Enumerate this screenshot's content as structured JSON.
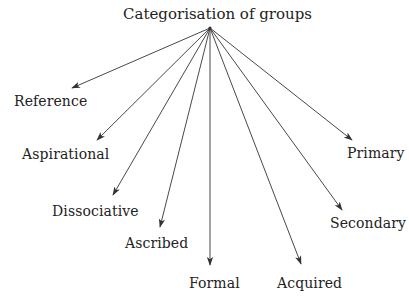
{
  "diagram": {
    "title": "Categorisation of groups",
    "line_color": "#333333",
    "text_color": "#222222",
    "root": "Categorisation of groups",
    "categories": [
      {
        "id": "reference",
        "label": "Reference"
      },
      {
        "id": "aspirational",
        "label": "Aspirational"
      },
      {
        "id": "dissociative",
        "label": "Dissociative"
      },
      {
        "id": "ascribed",
        "label": "Ascribed"
      },
      {
        "id": "formal",
        "label": "Formal"
      },
      {
        "id": "acquired",
        "label": "Acquired"
      },
      {
        "id": "secondary",
        "label": "Secondary"
      },
      {
        "id": "primary",
        "label": "Primary"
      }
    ],
    "edges": [
      {
        "from": "root",
        "to": "reference"
      },
      {
        "from": "root",
        "to": "aspirational"
      },
      {
        "from": "root",
        "to": "dissociative"
      },
      {
        "from": "root",
        "to": "ascribed"
      },
      {
        "from": "root",
        "to": "formal"
      },
      {
        "from": "root",
        "to": "acquired"
      },
      {
        "from": "root",
        "to": "secondary"
      },
      {
        "from": "root",
        "to": "primary"
      }
    ]
  }
}
